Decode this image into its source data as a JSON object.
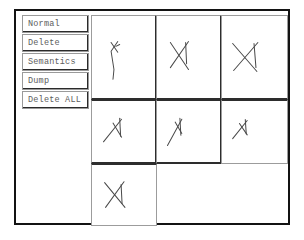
{
  "window": {
    "background_color": "#ffffff",
    "frame_color": "#131313"
  },
  "command_panel": {
    "name": "command-button-panel",
    "buttons": [
      {
        "id": "normal",
        "label": "Normal"
      },
      {
        "id": "delete",
        "label": "Delete"
      },
      {
        "id": "semantics",
        "label": "Semantics"
      },
      {
        "id": "dump",
        "label": "Dump"
      },
      {
        "id": "delete-all",
        "label": "Delete ALL"
      }
    ],
    "text_color": "#5d5d5d"
  },
  "sketch_grid": {
    "name": "sketch-thumbnail-grid",
    "columns": 3,
    "rows": 3,
    "ink_color": "#4a4a4a",
    "cell_border_color": "#9c9c9c",
    "divider_color": "#2d2d2d",
    "cells": [
      {
        "id": "cell-r1c1",
        "row": 1,
        "column": 1,
        "occupied": true,
        "label": "sketch-thumbnail-1",
        "strokes": [
          "M 20 12 L 27 22",
          "M 27 11 L 20 21 L 23 40 L 22 50",
          "M 25 16 L 29 14"
        ]
      },
      {
        "id": "cell-r1c2",
        "row": 1,
        "column": 2,
        "occupied": true,
        "label": "sketch-thumbnail-2",
        "strokes": [
          "M 14 12 L 33 40",
          "M 33 11 L 14 38",
          "M 30 12 L 31 34"
        ]
      },
      {
        "id": "cell-r1c3",
        "row": 1,
        "column": 3,
        "occupied": true,
        "label": "sketch-thumbnail-3",
        "strokes": [
          "M 11 13 L 36 42",
          "M 37 12 L 12 41",
          "M 33 13 L 35 38"
        ]
      },
      {
        "id": "cell-r2c1",
        "row": 2,
        "column": 1,
        "occupied": true,
        "label": "sketch-thumbnail-4",
        "strokes": [
          "M 12 38 L 31 14",
          "M 22 18 L 31 33",
          "M 29 13 L 30 32"
        ]
      },
      {
        "id": "cell-r2c2",
        "row": 2,
        "column": 2,
        "occupied": true,
        "label": "sketch-thumbnail-5",
        "strokes": [
          "M 11 42 L 26 14",
          "M 19 17 L 26 29",
          "M 24 13 L 25 31"
        ]
      },
      {
        "id": "cell-r2c3",
        "row": 2,
        "column": 3,
        "occupied": true,
        "label": "sketch-thumbnail-6",
        "strokes": [
          "M 11 34 L 26 15",
          "M 18 18 L 26 30",
          "M 24 14 L 25 29"
        ]
      },
      {
        "id": "cell-r3c1",
        "row": 3,
        "column": 1,
        "occupied": true,
        "label": "sketch-thumbnail-7",
        "strokes": [
          "M 13 14 L 34 40",
          "M 33 13 L 14 40",
          "M 30 16 L 31 36"
        ]
      },
      {
        "id": "cell-r3c2",
        "row": 3,
        "column": 2,
        "occupied": false,
        "label": "sketch-cell-empty-1",
        "strokes": []
      },
      {
        "id": "cell-r3c3",
        "row": 3,
        "column": 3,
        "occupied": false,
        "label": "sketch-cell-empty-2",
        "strokes": []
      }
    ]
  }
}
